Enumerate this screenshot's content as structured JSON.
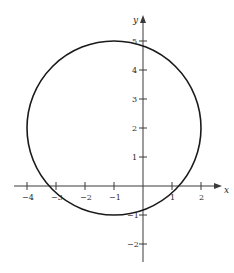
{
  "diagram": {
    "type": "circle-on-cartesian-plane",
    "axes": {
      "x_label": "x",
      "y_label": "y",
      "x_ticks": [
        {
          "value": -4,
          "label": "−4"
        },
        {
          "value": -3,
          "label": "−3"
        },
        {
          "value": -2,
          "label": "−2"
        },
        {
          "value": -1,
          "label": "−1"
        },
        {
          "value": 1,
          "label": "1"
        },
        {
          "value": 2,
          "label": "2"
        }
      ],
      "y_ticks": [
        {
          "value": 5,
          "label": "5"
        },
        {
          "value": 4,
          "label": "4"
        },
        {
          "value": 3,
          "label": "3"
        },
        {
          "value": 2,
          "label": "2"
        },
        {
          "value": 1,
          "label": "1"
        },
        {
          "value": -1,
          "label": "−1"
        },
        {
          "value": -2,
          "label": "−2"
        }
      ],
      "x_range": [
        -4.2,
        2.7
      ],
      "y_range": [
        -2.6,
        5.8
      ]
    },
    "circle": {
      "center": [
        -1,
        2
      ],
      "radius": 3,
      "stroke": "#1a1a1a"
    },
    "colors": {
      "axis": "#3a3a3a",
      "curve": "#1a1a1a",
      "background": "#ffffff"
    }
  }
}
